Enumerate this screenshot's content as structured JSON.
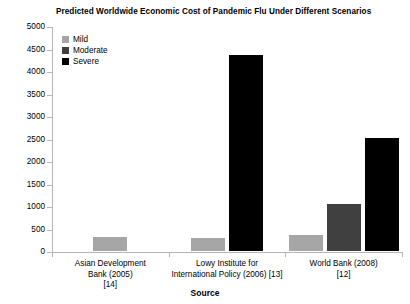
{
  "chart_data": {
    "type": "bar",
    "title": "Predicted Worldwide Economic Cost of Pandemic Flu Under Different Scenarios",
    "xlabel": "Source",
    "ylabel": "",
    "ylim": [
      0,
      5000
    ],
    "yticks": [
      0,
      500,
      1000,
      1500,
      2000,
      2500,
      3000,
      3500,
      4000,
      4500,
      5000
    ],
    "grid": false,
    "legend_position": "top-left-inside",
    "categories": [
      "Asian Development\nBank (2005)\n[14]",
      "Lowy Institute for\nInternational Policy (2006) [13]",
      "World Bank (2008)\n[12]"
    ],
    "series": [
      {
        "name": "Mild",
        "color": "#a6a6a6",
        "values": [
          350,
          330,
          400
        ]
      },
      {
        "name": "Moderate",
        "color": "#404040",
        "values": [
          null,
          null,
          1100
        ]
      },
      {
        "name": "Severe",
        "color": "#000000",
        "values": [
          null,
          4400,
          2550
        ]
      }
    ]
  },
  "legend": {
    "items": [
      {
        "label": "Mild",
        "color": "#a6a6a6"
      },
      {
        "label": "Moderate",
        "color": "#404040"
      },
      {
        "label": "Severe",
        "color": "#000000"
      }
    ]
  },
  "axis": {
    "y_tick_labels": [
      "5000",
      "4500",
      "4000",
      "3500",
      "3000",
      "2500",
      "2000",
      "1500",
      "1000",
      "500",
      "0"
    ],
    "x_title": "Source",
    "x_category_labels": [
      "Asian Development\nBank (2005)\n[14]",
      "Lowy Institute for\nInternational Policy (2006) [13]",
      "World Bank (2008)\n[12]"
    ]
  }
}
